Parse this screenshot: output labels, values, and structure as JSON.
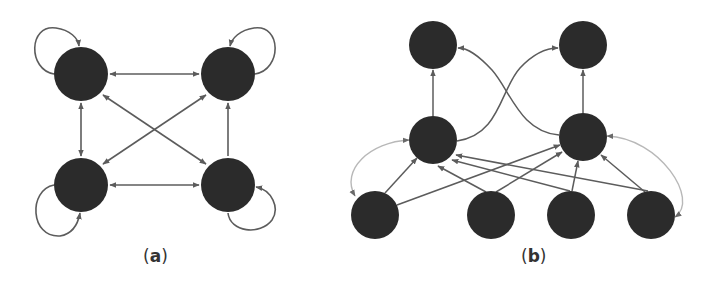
{
  "figure": {
    "colors": {
      "node_fill": "#2b2b2b",
      "edge": "#5c5c5c",
      "edge_light": "#b8b8b8",
      "background": "#ffffff"
    },
    "panels": [
      {
        "id": "a",
        "caption_open": "(",
        "caption_letter": "a",
        "caption_close": ")",
        "node_radius": 27,
        "nodes": [
          {
            "id": "a1",
            "x": 81,
            "y": 74,
            "self_loop": "top-left"
          },
          {
            "id": "a2",
            "x": 228,
            "y": 74,
            "self_loop": "top-right"
          },
          {
            "id": "a3",
            "x": 81,
            "y": 185,
            "self_loop": "bottom-left"
          },
          {
            "id": "a4",
            "x": 228,
            "y": 185,
            "self_loop": "bottom-right"
          }
        ],
        "edges": [
          {
            "from": "a1",
            "to": "a2",
            "bidirectional": true
          },
          {
            "from": "a3",
            "to": "a4",
            "bidirectional": true
          },
          {
            "from": "a1",
            "to": "a3",
            "bidirectional": true
          },
          {
            "from": "a4",
            "to": "a2",
            "bidirectional": false
          },
          {
            "from": "a1",
            "to": "a4",
            "bidirectional": true
          },
          {
            "from": "a3",
            "to": "a2",
            "bidirectional": true
          }
        ]
      },
      {
        "id": "b",
        "caption_open": "(",
        "caption_letter": "b",
        "caption_close": ")",
        "node_radius": 24,
        "nodes": [
          {
            "id": "top-left",
            "x": 433,
            "y": 45
          },
          {
            "id": "top-right",
            "x": 583,
            "y": 45
          },
          {
            "id": "mid-left",
            "x": 433,
            "y": 140
          },
          {
            "id": "mid-right",
            "x": 583,
            "y": 137
          },
          {
            "id": "bottom-1",
            "x": 375,
            "y": 215
          },
          {
            "id": "bottom-2",
            "x": 491,
            "y": 215
          },
          {
            "id": "bottom-3",
            "x": 571,
            "y": 215
          },
          {
            "id": "bottom-4",
            "x": 651,
            "y": 215
          }
        ],
        "edges": [
          {
            "from": "mid-left",
            "to": "top-left",
            "style": "straight"
          },
          {
            "from": "mid-right",
            "to": "top-right",
            "style": "straight"
          },
          {
            "from": "mid-left",
            "to": "top-right",
            "style": "curve"
          },
          {
            "from": "mid-right",
            "to": "top-left",
            "style": "curve"
          },
          {
            "from": "bottom-1",
            "to": "mid-left",
            "style": "straight"
          },
          {
            "from": "bottom-1",
            "to": "mid-right",
            "style": "straight"
          },
          {
            "from": "bottom-2",
            "to": "mid-left",
            "style": "straight"
          },
          {
            "from": "bottom-2",
            "to": "mid-right",
            "style": "straight"
          },
          {
            "from": "bottom-3",
            "to": "mid-left",
            "style": "straight"
          },
          {
            "from": "bottom-3",
            "to": "mid-right",
            "style": "straight"
          },
          {
            "from": "bottom-4",
            "to": "mid-left",
            "style": "straight"
          },
          {
            "from": "bottom-4",
            "to": "mid-right",
            "style": "straight"
          },
          {
            "from": "mid-left",
            "to": "bottom-1",
            "style": "light-arc",
            "bidirectional": true
          },
          {
            "from": "mid-right",
            "to": "bottom-4",
            "style": "light-arc",
            "bidirectional": true
          }
        ]
      }
    ]
  }
}
